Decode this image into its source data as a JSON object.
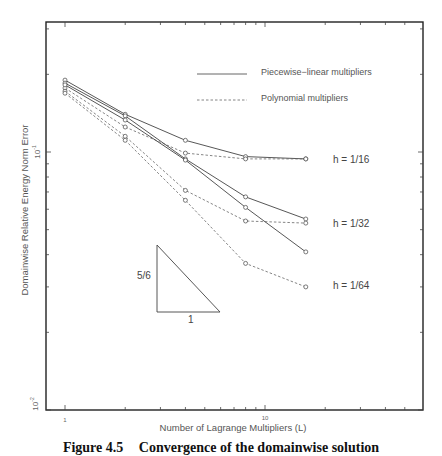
{
  "chart_data": {
    "type": "line",
    "title": "",
    "xlabel": "Number of Lagrange Multipliers (L)",
    "ylabel": "Domainwise Relative Energy Norm Error",
    "xscale": "log",
    "yscale": "log",
    "xlim": [
      0.9,
      20
    ],
    "ylim": [
      0.01,
      0.32
    ],
    "x_tick_labels": [
      "1",
      "10"
    ],
    "y_tick_labels": [
      "10^-1",
      "10^-2"
    ],
    "grid": false,
    "legend": {
      "position": "upper right",
      "entries": [
        {
          "label": "Piecewise−linear multipliers",
          "style": "solid"
        },
        {
          "label": "Polynomial multipliers",
          "style": "dashed"
        }
      ]
    },
    "x": [
      1,
      2,
      4,
      8,
      16
    ],
    "series": [
      {
        "name": "Piecewise-linear, h = 1/16",
        "style": "solid",
        "values": [
          0.19,
          0.14,
          0.111,
          0.096,
          0.094
        ]
      },
      {
        "name": "Polynomial, h = 1/16",
        "style": "dashed",
        "values": [
          0.177,
          0.125,
          0.099,
          0.094,
          0.094
        ]
      },
      {
        "name": "Piecewise-linear, h = 1/32",
        "style": "solid",
        "values": [
          0.185,
          0.138,
          0.094,
          0.067,
          0.055
        ]
      },
      {
        "name": "Polynomial, h = 1/32",
        "style": "dashed",
        "values": [
          0.172,
          0.115,
          0.071,
          0.054,
          0.053
        ]
      },
      {
        "name": "Piecewise-linear, h = 1/64",
        "style": "solid",
        "values": [
          0.182,
          0.133,
          0.093,
          0.061,
          0.041
        ]
      },
      {
        "name": "Polynomial, h = 1/64",
        "style": "dashed",
        "values": [
          0.169,
          0.111,
          0.065,
          0.037,
          0.03
        ]
      }
    ],
    "annotations": [
      {
        "text": "h = 1/16",
        "x": 16,
        "y": 0.094
      },
      {
        "text": "h = 1/32",
        "x": 16,
        "y": 0.054
      },
      {
        "text": "h = 1/64",
        "x": 16,
        "y": 0.03
      },
      {
        "text": "slope triangle",
        "rise_label": "5/6",
        "run_label": "1"
      }
    ]
  },
  "labels": {
    "xlabel": "Number of Lagrange Multipliers (L)",
    "ylabel": "Domainwise Relative Energy Norm Error",
    "x_tick_1": "1",
    "x_tick_10": "10",
    "y_tick_m1_base": "10",
    "y_tick_m1_exp": "-1",
    "y_tick_m2_base": "10",
    "y_tick_m2_exp": "-2",
    "legend_solid": "Piecewise−linear multipliers",
    "legend_dashed": "Polynomial multipliers",
    "h16": "h = 1/16",
    "h32": "h = 1/32",
    "h64": "h = 1/64",
    "slope_rise": "5/6",
    "slope_run": "1"
  },
  "caption": {
    "number": "Figure 4.5",
    "text": "Convergence of the domainwise solution"
  }
}
